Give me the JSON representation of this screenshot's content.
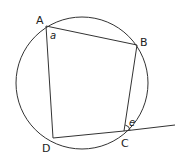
{
  "diagram": {
    "type": "cyclic-quadrilateral",
    "circle": {
      "cx": 82,
      "cy": 83,
      "r": 66
    },
    "points": {
      "A": {
        "x": 46,
        "y": 26,
        "label": "A"
      },
      "B": {
        "x": 137,
        "y": 45,
        "label": "B"
      },
      "C": {
        "x": 124,
        "y": 131,
        "label": "C"
      },
      "D": {
        "x": 53,
        "y": 138,
        "label": "D"
      }
    },
    "extension": {
      "from": "C",
      "to": {
        "x": 175,
        "y": 125
      }
    },
    "angle_labels": {
      "a": "a",
      "e": "e"
    },
    "colors": {
      "line": "#333333",
      "text": "#222222"
    }
  }
}
